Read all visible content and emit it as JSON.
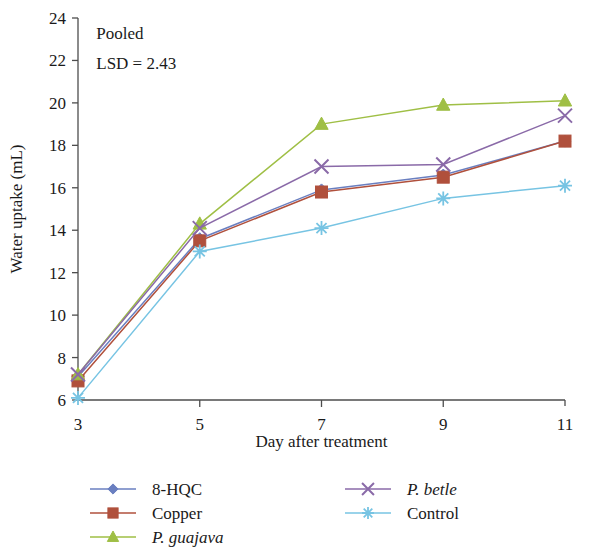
{
  "chart_data": {
    "type": "line",
    "title": "",
    "xlabel": "Day after treatment",
    "ylabel": "Water uptake (mL)",
    "x": [
      3,
      5,
      7,
      9,
      11
    ],
    "categories": [
      "3",
      "5",
      "7",
      "9",
      "11"
    ],
    "xlim": [
      3,
      11
    ],
    "ylim": [
      6,
      24
    ],
    "yticks": [
      6,
      8,
      10,
      12,
      14,
      16,
      18,
      20,
      22,
      24
    ],
    "xticks": [
      3,
      5,
      7,
      9,
      11
    ],
    "grid": false,
    "legend_position": "bottom",
    "annotations": [
      {
        "text": "Pooled",
        "x": 3.3,
        "y": 23.3
      },
      {
        "text": "LSD = 2.43",
        "x": 3.3,
        "y": 21.9
      }
    ],
    "series": [
      {
        "name": "8-HQC",
        "values": [
          7.1,
          13.6,
          15.9,
          16.6,
          18.2
        ],
        "color": "#6a7fc0",
        "marker": "diamond",
        "italic": false
      },
      {
        "name": "Copper",
        "values": [
          6.9,
          13.5,
          15.8,
          16.5,
          18.2
        ],
        "color": "#b0503c",
        "marker": "square",
        "italic": false
      },
      {
        "name": "P. guajava",
        "values": [
          7.2,
          14.3,
          19.0,
          19.9,
          20.1
        ],
        "color": "#9fbf45",
        "marker": "triangle",
        "italic": true
      },
      {
        "name": "P. betle",
        "values": [
          7.2,
          14.1,
          17.0,
          17.1,
          19.4
        ],
        "color": "#8a6aa8",
        "marker": "cross",
        "italic": true
      },
      {
        "name": "Control",
        "values": [
          6.1,
          13.0,
          14.1,
          15.5,
          16.1
        ],
        "color": "#77c4e3",
        "marker": "asterisk",
        "italic": false
      }
    ]
  },
  "legend": {
    "entries": [
      {
        "label": "8-HQC",
        "marker": "diamond-marker",
        "italic": false
      },
      {
        "label": "Copper",
        "marker": "square-marker",
        "italic": false
      },
      {
        "label": "P. guajava",
        "marker": "triangle-marker",
        "italic": true
      },
      {
        "label": "P. betle",
        "marker": "cross-marker",
        "italic": true
      },
      {
        "label": "Control",
        "marker": "asterisk-marker",
        "italic": false
      }
    ]
  }
}
